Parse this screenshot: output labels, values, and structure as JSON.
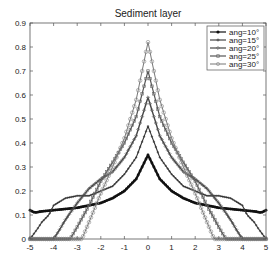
{
  "chart_data": {
    "type": "line",
    "title": "Sediment layer",
    "xlabel": "",
    "ylabel": "",
    "xlim": [
      -5,
      5
    ],
    "ylim": [
      0,
      0.9
    ],
    "xticks": [
      -5,
      -4,
      -3,
      -2,
      -1,
      0,
      1,
      2,
      3,
      4,
      5
    ],
    "yticks": [
      0,
      0.1,
      0.2,
      0.3,
      0.4,
      0.5,
      0.6,
      0.7,
      0.8,
      0.9
    ],
    "ytick_labels": [
      "0",
      "0.1",
      "0.2",
      "0.3",
      "0.4",
      "0.5",
      "0.6",
      "0.7",
      "0.8",
      "0.9"
    ],
    "grid": false,
    "legend_position": "upper right",
    "series": [
      {
        "name": "ang=10°",
        "marker": "dot",
        "x": [
          -5,
          -4.8,
          -4.5,
          -4,
          -3.5,
          -3,
          -2.5,
          -2,
          -1.5,
          -1,
          -0.5,
          0,
          0.5,
          1,
          1.5,
          2,
          2.5,
          3,
          3.5,
          4,
          4.5,
          4.8,
          5
        ],
        "y": [
          0.12,
          0.11,
          0.115,
          0.12,
          0.125,
          0.13,
          0.14,
          0.15,
          0.17,
          0.2,
          0.25,
          0.35,
          0.25,
          0.2,
          0.17,
          0.15,
          0.14,
          0.13,
          0.125,
          0.12,
          0.115,
          0.11,
          0.12
        ]
      },
      {
        "name": "ang=15°",
        "marker": "plus",
        "x": [
          -5,
          -4.7,
          -4.5,
          -4.2,
          -4,
          -3.5,
          -3,
          -2.5,
          -2,
          -1.5,
          -1,
          -0.5,
          0,
          0.5,
          1,
          1.5,
          2,
          2.5,
          3,
          3.5,
          4,
          4.2,
          4.5,
          4.7,
          5
        ],
        "y": [
          0,
          0.04,
          0.07,
          0.1,
          0.14,
          0.17,
          0.18,
          0.18,
          0.2,
          0.22,
          0.27,
          0.34,
          0.47,
          0.34,
          0.27,
          0.22,
          0.2,
          0.18,
          0.18,
          0.17,
          0.14,
          0.1,
          0.07,
          0.04,
          0
        ]
      },
      {
        "name": "ang=20°",
        "marker": "diamond",
        "x": [
          -5,
          -4,
          -3.8,
          -3.5,
          -3,
          -2.5,
          -2,
          -1.5,
          -1,
          -0.5,
          0,
          0.5,
          1,
          1.5,
          2,
          2.5,
          3,
          3.5,
          3.8,
          4,
          5
        ],
        "y": [
          0,
          0,
          0.03,
          0.08,
          0.15,
          0.21,
          0.25,
          0.28,
          0.34,
          0.43,
          0.59,
          0.43,
          0.34,
          0.28,
          0.25,
          0.21,
          0.15,
          0.08,
          0.03,
          0,
          0
        ]
      },
      {
        "name": "ang=25°",
        "marker": "square",
        "x": [
          -5,
          -3.3,
          -3,
          -2.5,
          -2,
          -1.5,
          -1,
          -0.5,
          0,
          0.5,
          1,
          1.5,
          2,
          2.5,
          3,
          3.3,
          5
        ],
        "y": [
          0,
          0,
          0.05,
          0.14,
          0.24,
          0.32,
          0.4,
          0.51,
          0.7,
          0.51,
          0.4,
          0.32,
          0.24,
          0.14,
          0.05,
          0,
          0
        ]
      },
      {
        "name": "ang=30°",
        "marker": "circle",
        "x": [
          -5,
          -2.8,
          -2.5,
          -2,
          -1.5,
          -1,
          -0.5,
          0,
          0.5,
          1,
          1.5,
          2,
          2.5,
          2.8,
          5
        ],
        "y": [
          0,
          0,
          0.07,
          0.19,
          0.3,
          0.42,
          0.58,
          0.82,
          0.58,
          0.42,
          0.3,
          0.19,
          0.07,
          0,
          0
        ]
      }
    ]
  },
  "colors": {
    "axis": "#555555",
    "line_dark": "#111111",
    "line_mid": "#555555",
    "line_light": "#888888"
  }
}
